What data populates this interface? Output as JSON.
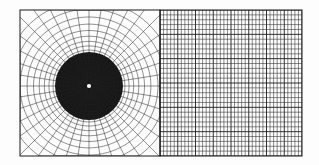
{
  "figure": {
    "kind": "computational-mesh-comparison",
    "canvas": {
      "width": 319,
      "height": 165
    },
    "background_color": "#ffffff",
    "paper_tint_color": "#fdfdfd",
    "line_color": "#222222",
    "line_color_soft": "#555555",
    "border_color": "#1a1a1a"
  },
  "panels": [
    {
      "id": "polar-mesh",
      "label": "polar radial mesh",
      "mesh_type": "polar",
      "bounds": {
        "x0": 20,
        "y0": 10,
        "x1": 160,
        "y1": 156
      },
      "center": {
        "x": 89,
        "y": 86
      },
      "center_hole_radius": 2.1,
      "center_hole_color": "#ffffff",
      "radial_spokes": 40,
      "rings": 36,
      "ring_growth": 1.115,
      "ring_inner_radius": 1.9,
      "line_width": 0.5,
      "line_color": "#222222",
      "core_dark_radius": 34,
      "core_dark_color": "#171717"
    },
    {
      "id": "cartesian-mesh",
      "label": "cartesian rectilinear mesh",
      "mesh_type": "cartesian",
      "bounds": {
        "x0": 160,
        "y0": 10,
        "x1": 302,
        "y1": 156
      },
      "columns": 40,
      "rows": 30,
      "line_width": 0.55,
      "line_color": "#2a2a2a",
      "major_every": 5,
      "major_line_width": 0.9,
      "major_line_color": "#1c1c1c"
    }
  ],
  "annotations": {
    "has_text_labels": false,
    "has_axis_ticks": false,
    "has_legend": false,
    "has_title": false
  }
}
